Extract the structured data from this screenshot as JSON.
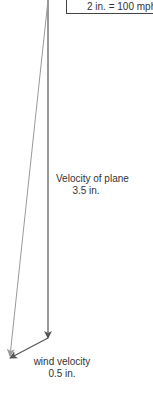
{
  "scale": {
    "text": "2 in. = 100 mph"
  },
  "vectors": {
    "plane": {
      "label": "Velocity of plane",
      "length": "3.5 in.",
      "color": "#555555"
    },
    "wind": {
      "label": "wind velocity",
      "length": "0.5 in.",
      "color": "#555555"
    },
    "resultant": {
      "color": "#999999"
    }
  }
}
